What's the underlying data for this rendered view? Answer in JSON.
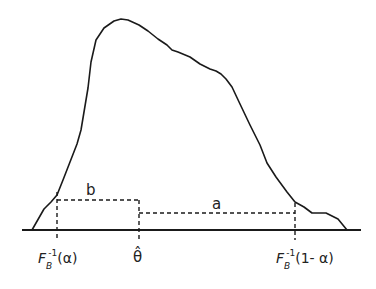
{
  "diagram": {
    "labels": {
      "b": "b",
      "a": "a",
      "theta_hat": "θ̂",
      "left_quantile": {
        "F": "F",
        "sub": "B",
        "sup": "-1",
        "arg": "(α)"
      },
      "right_quantile": {
        "F": "F",
        "sub": "B",
        "sup": "-1",
        "arg": "(1- α)"
      }
    },
    "colors": {
      "line": "#1a1a1a",
      "background": "#ffffff"
    }
  }
}
